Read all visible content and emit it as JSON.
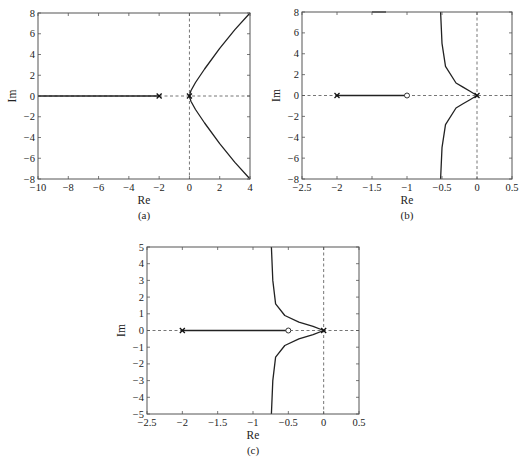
{
  "chart_data": [
    {
      "id": "a",
      "type": "line",
      "caption": "(a)",
      "xlabel": "Re",
      "ylabel": "Im",
      "xlim": [
        -10,
        4
      ],
      "ylim": [
        -8,
        8
      ],
      "xticks": [
        -10,
        -8,
        -6,
        -4,
        -2,
        0,
        2,
        4
      ],
      "yticks": [
        -8,
        -6,
        -4,
        -2,
        0,
        2,
        4,
        6,
        8
      ],
      "xtick_labels": [
        "−10",
        "−8",
        "−6",
        "−4",
        "−2",
        "0",
        "2",
        "4"
      ],
      "ytick_labels": [
        "−8",
        "−6",
        "−4",
        "−2",
        "0",
        "2",
        "4",
        "6",
        "8"
      ],
      "grid": false,
      "poles": [
        [
          -2,
          0
        ],
        [
          0,
          0
        ]
      ],
      "zeros": [],
      "series": [
        {
          "name": "real-axis locus",
          "x": [
            -10,
            -2
          ],
          "y": [
            0,
            0
          ]
        },
        {
          "name": "upper branch",
          "x": [
            0,
            0.1,
            0.4,
            1.0,
            2.0,
            3.0,
            4.0
          ],
          "y": [
            0,
            0.5,
            1.3,
            2.6,
            4.6,
            6.4,
            8.0
          ]
        },
        {
          "name": "lower branch",
          "x": [
            0,
            0.1,
            0.4,
            1.0,
            2.0,
            3.0,
            4.0
          ],
          "y": [
            0,
            -0.5,
            -1.3,
            -2.6,
            -4.6,
            -6.4,
            -8.0
          ]
        }
      ]
    },
    {
      "id": "b",
      "type": "line",
      "caption": "(b)",
      "xlabel": "Re",
      "ylabel": "Im",
      "xlim": [
        -2.5,
        0.5
      ],
      "ylim": [
        -8,
        8
      ],
      "xticks": [
        -2.5,
        -2,
        -1.5,
        -1,
        -0.5,
        0,
        0.5
      ],
      "yticks": [
        -8,
        -6,
        -4,
        -2,
        0,
        2,
        4,
        6,
        8
      ],
      "xtick_labels": [
        "−2.5",
        "−2",
        "−1.5",
        "−1",
        "−0.5",
        "0",
        "0.5"
      ],
      "ytick_labels": [
        "−8",
        "−6",
        "−4",
        "−2",
        "0",
        "2",
        "4",
        "6",
        "8"
      ],
      "grid": false,
      "poles": [
        [
          -2,
          0
        ],
        [
          0,
          0
        ]
      ],
      "zeros": [
        [
          -1,
          0
        ]
      ],
      "series": [
        {
          "name": "real-axis locus",
          "x": [
            -2,
            -1
          ],
          "y": [
            0,
            0
          ]
        },
        {
          "name": "upper branch",
          "x": [
            0,
            -0.1,
            -0.2,
            -0.3,
            -0.45,
            -0.5,
            -0.52
          ],
          "y": [
            0,
            0.4,
            0.8,
            1.2,
            2.8,
            5.0,
            8.0
          ]
        },
        {
          "name": "lower branch",
          "x": [
            0,
            -0.1,
            -0.2,
            -0.3,
            -0.45,
            -0.5,
            -0.52
          ],
          "y": [
            0,
            -0.4,
            -0.8,
            -1.2,
            -2.8,
            -5.0,
            -8.0
          ]
        },
        {
          "name": "top fragment",
          "x": [
            -1.5,
            -1.3
          ],
          "y": [
            8.0,
            8.0
          ]
        }
      ]
    },
    {
      "id": "c",
      "type": "line",
      "caption": "(c)",
      "xlabel": "Re",
      "ylabel": "Im",
      "xlim": [
        -2.5,
        0.5
      ],
      "ylim": [
        -5,
        5
      ],
      "xticks": [
        -2.5,
        -2,
        -1.5,
        -1,
        -0.5,
        0,
        0.5
      ],
      "yticks": [
        -5,
        -4,
        -3,
        -2,
        -1,
        0,
        1,
        2,
        3,
        4,
        5
      ],
      "xtick_labels": [
        "−2.5",
        "−2",
        "−1.5",
        "−1",
        "−0.5",
        "0",
        "0.5"
      ],
      "ytick_labels": [
        "−5",
        "−4",
        "−3",
        "−2",
        "−1",
        "0",
        "1",
        "2",
        "3",
        "4",
        "5"
      ],
      "grid": false,
      "poles": [
        [
          -2,
          0
        ],
        [
          0,
          0
        ]
      ],
      "zeros": [
        [
          -0.5,
          0
        ]
      ],
      "series": [
        {
          "name": "real-axis locus",
          "x": [
            -2,
            -0.5
          ],
          "y": [
            0,
            0
          ]
        },
        {
          "name": "upper branch",
          "x": [
            0,
            -0.15,
            -0.35,
            -0.55,
            -0.68,
            -0.72,
            -0.74
          ],
          "y": [
            0,
            0.25,
            0.5,
            0.9,
            1.6,
            3.0,
            5.0
          ]
        },
        {
          "name": "lower branch",
          "x": [
            0,
            -0.15,
            -0.35,
            -0.55,
            -0.68,
            -0.72,
            -0.74
          ],
          "y": [
            0,
            -0.25,
            -0.5,
            -0.9,
            -1.6,
            -3.0,
            -5.0
          ]
        }
      ]
    }
  ]
}
